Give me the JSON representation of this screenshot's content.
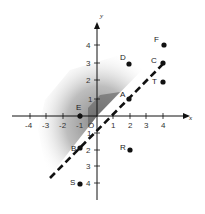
{
  "diagram": {
    "axes": {
      "x_label": "x",
      "y_label": "y",
      "origin_label": "O",
      "x_ticks": [
        "-4",
        "-3",
        "-2",
        "-1",
        "1",
        "2",
        "3",
        "4"
      ],
      "y_ticks": [
        "4",
        "3",
        "2",
        "1",
        "1",
        "2",
        "3",
        "4"
      ]
    },
    "points": [
      {
        "label": "F",
        "x": 4,
        "y": 4
      },
      {
        "label": "C",
        "x": 4,
        "y": 3
      },
      {
        "label": "T",
        "x": 4,
        "y": 2
      },
      {
        "label": "D",
        "x": 2,
        "y": 3
      },
      {
        "label": "A",
        "x": 2,
        "y": 1
      },
      {
        "label": "E",
        "x": -1,
        "y": 0
      },
      {
        "label": "R",
        "x": 2,
        "y": -2
      },
      {
        "label": "B",
        "x": -1,
        "y": -2
      },
      {
        "label": "S",
        "x": -1,
        "y": -4
      }
    ],
    "line": {
      "equation": "y = x",
      "style": "dashed"
    },
    "shaded_region": "y > x (gray gradient)",
    "colors": {
      "ink": "#111111",
      "shade": "#9a9a9a"
    }
  }
}
